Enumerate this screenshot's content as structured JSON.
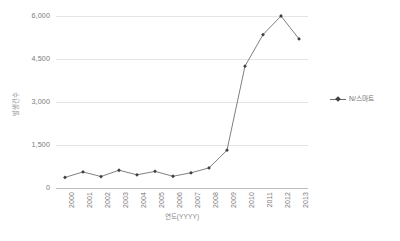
{
  "chart_data": {
    "type": "line",
    "title": "",
    "xlabel": "연도(YYYY)",
    "ylabel": "발생건수",
    "categories": [
      "2000",
      "2001",
      "2002",
      "2003",
      "2004",
      "2005",
      "2006",
      "2007",
      "2008",
      "2009",
      "2010",
      "2011",
      "2012",
      "2013"
    ],
    "series": [
      {
        "name": "N/스마트",
        "values": [
          370,
          560,
          400,
          620,
          460,
          580,
          410,
          530,
          700,
          1320,
          4250,
          5350,
          6000,
          5200
        ]
      }
    ],
    "ylim": [
      0,
      6000
    ],
    "yticks": [
      0,
      1500,
      3000,
      4500,
      6000
    ],
    "ytick_labels": [
      "0",
      "1,500",
      "3,000",
      "4,500",
      "6,000"
    ],
    "grid": true,
    "legend_position": "right",
    "marker": "diamond",
    "line_color": "#808080",
    "marker_color": "#3f3f3f",
    "grid_color": "#e4e4e4",
    "axis_color": "#bdbdbd",
    "text_color": "#7a7a7a"
  },
  "legend": {
    "entries": [
      {
        "label": "N/스마트"
      }
    ]
  }
}
